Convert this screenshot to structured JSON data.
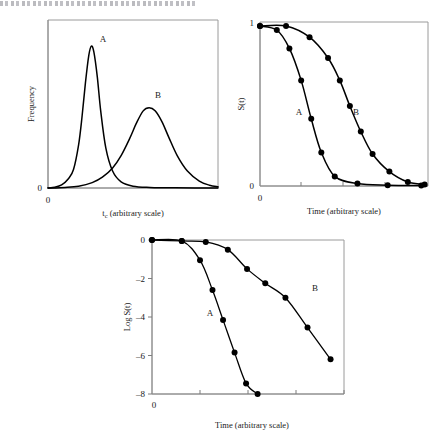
{
  "figure": {
    "page_header_text": "",
    "background_color": "#ffffff",
    "ink_color": "#000000",
    "frame_color": "#9a9a9a"
  },
  "panels": [
    {
      "id": "frequency",
      "name": "frequency-distribution-panel",
      "ylabel": "Frequency",
      "xlabel_main": "t",
      "xlabel_sub": "c",
      "xlabel_rest": " (arbitrary scale)",
      "y_ticks": [
        "0"
      ],
      "x_ticks": [
        "0"
      ],
      "curve_labels": [
        "A",
        "B"
      ]
    },
    {
      "id": "survival",
      "name": "survival-function-panel",
      "ylabel": "S(t)",
      "xlabel": "Time (arbitrary scale)",
      "y_ticks": [
        "1",
        "0"
      ],
      "x_ticks": [
        "0"
      ],
      "curve_labels": [
        "A",
        "B"
      ]
    },
    {
      "id": "logsurvival",
      "name": "log-survival-panel",
      "ylabel": "Log S(t)",
      "xlabel": "Time (arbitrary scale)",
      "y_ticks": [
        "0",
        "–2",
        "–4",
        "–6",
        "–8"
      ],
      "x_ticks": [
        "0"
      ],
      "curve_labels": [
        "A",
        "B"
      ]
    }
  ],
  "chart_data": [
    {
      "type": "line",
      "id": "frequency",
      "title": "",
      "xlabel": "t_c (arbitrary scale)",
      "ylabel": "Frequency",
      "xlim": [
        0,
        10
      ],
      "ylim": [
        0,
        1.05
      ],
      "grid": false,
      "legend": "inline-annotations",
      "annotations": [
        {
          "text": "A",
          "x": 2.55,
          "y": 1.03
        },
        {
          "text": "B",
          "x": 5.85,
          "y": 0.62
        }
      ],
      "series": [
        {
          "name": "A",
          "description": "narrow tall unimodal frequency distribution",
          "peak_x": 2.55,
          "peak_y": 0.92,
          "width": 0.62,
          "x": [
            0.0,
            0.4,
            0.8,
            1.2,
            1.5,
            1.8,
            2.0,
            2.2,
            2.4,
            2.55,
            2.7,
            2.9,
            3.1,
            3.4,
            3.8,
            4.3,
            5.0,
            6.0,
            7.5,
            10.0
          ],
          "y": [
            0.0,
            0.005,
            0.02,
            0.06,
            0.12,
            0.28,
            0.46,
            0.68,
            0.86,
            0.92,
            0.88,
            0.72,
            0.5,
            0.26,
            0.11,
            0.04,
            0.012,
            0.004,
            0.001,
            0.0
          ]
        },
        {
          "name": "B",
          "description": "broader shorter unimodal frequency distribution",
          "peak_x": 5.95,
          "peak_y": 0.52,
          "width": 1.15,
          "x": [
            0.0,
            1.0,
            1.8,
            2.6,
            3.2,
            3.8,
            4.3,
            4.8,
            5.2,
            5.6,
            5.95,
            6.3,
            6.7,
            7.1,
            7.6,
            8.2,
            8.9,
            9.5,
            10.0
          ],
          "y": [
            0.0,
            0.004,
            0.012,
            0.035,
            0.07,
            0.13,
            0.21,
            0.32,
            0.42,
            0.5,
            0.52,
            0.5,
            0.43,
            0.33,
            0.21,
            0.11,
            0.045,
            0.018,
            0.008
          ]
        }
      ]
    },
    {
      "type": "line",
      "id": "survival",
      "title": "",
      "xlabel": "Time (arbitrary scale)",
      "ylabel": "S(t)",
      "xlim": [
        0,
        10
      ],
      "ylim": [
        0,
        1
      ],
      "grid": false,
      "legend": "inline-annotations",
      "markers": "filled-circle",
      "annotations": [
        {
          "text": "A",
          "x": 2.15,
          "y": 0.47
        },
        {
          "text": "B",
          "x": 5.55,
          "y": 0.47
        }
      ],
      "series": [
        {
          "name": "A",
          "points_x": [
            0.0,
            1.0,
            1.75,
            2.45,
            3.05,
            3.65,
            4.45,
            5.8,
            7.6,
            9.6
          ],
          "points_y": [
            1.0,
            0.975,
            0.86,
            0.66,
            0.42,
            0.21,
            0.06,
            0.015,
            0.005,
            0.003
          ]
        },
        {
          "name": "B",
          "points_x": [
            0.0,
            1.55,
            2.95,
            4.05,
            4.75,
            5.35,
            6.0,
            6.7,
            7.7,
            8.8,
            9.8
          ],
          "points_y": [
            1.0,
            1.0,
            0.93,
            0.8,
            0.66,
            0.5,
            0.34,
            0.2,
            0.09,
            0.025,
            0.01
          ]
        }
      ]
    },
    {
      "type": "line",
      "id": "logsurvival",
      "title": "",
      "xlabel": "Time (arbitrary scale)",
      "ylabel": "Log S(t)",
      "xlim": [
        0,
        10
      ],
      "ylim": [
        -8,
        0
      ],
      "grid": false,
      "legend": "inline-annotations",
      "markers": "filled-circle",
      "annotations": [
        {
          "text": "A",
          "x": 3.05,
          "y": -4.0
        },
        {
          "text": "B",
          "x": 7.3,
          "y": -2.55
        }
      ],
      "series": [
        {
          "name": "A",
          "points_x": [
            0.0,
            1.55,
            2.5,
            3.15,
            3.7,
            4.3,
            4.9,
            5.5
          ],
          "points_y": [
            0.0,
            -0.05,
            -1.05,
            -2.6,
            -4.15,
            -5.85,
            -7.45,
            -8.0
          ]
        },
        {
          "name": "B",
          "points_x": [
            0.0,
            1.55,
            2.8,
            3.95,
            4.95,
            5.9,
            6.95,
            8.1,
            9.3
          ],
          "points_y": [
            0.0,
            -0.05,
            -0.1,
            -0.5,
            -1.5,
            -2.25,
            -3.0,
            -4.55,
            -6.2
          ]
        }
      ]
    }
  ]
}
